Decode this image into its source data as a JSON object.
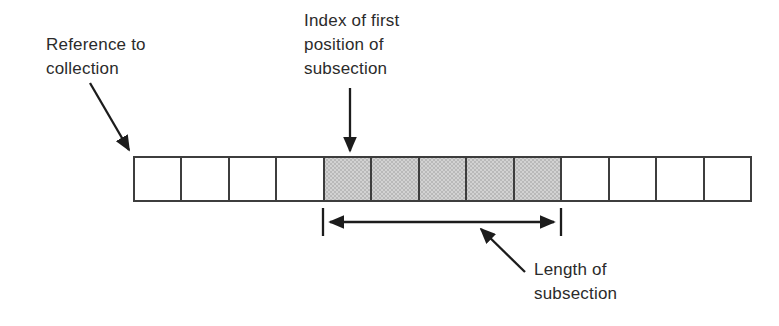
{
  "figure": {
    "labels": {
      "reference": "Reference to\ncollection",
      "index": "Index of first\nposition of\nsubsection",
      "length": "Length of\nsubsection"
    },
    "array": {
      "cell_count": 13,
      "shaded_start_index": 4,
      "shaded_count": 5,
      "cells": [
        false,
        false,
        false,
        false,
        true,
        true,
        true,
        true,
        true,
        false,
        false,
        false,
        false
      ]
    },
    "colors": {
      "background": "#ffffff",
      "cell_fill": "#ffffff",
      "shaded_fill": "#d2d2d2",
      "shaded_dot": "#b9b9b9",
      "border": "#3d3d3d",
      "arrow": "#1c1c1c",
      "text": "#2b2b2b"
    }
  }
}
